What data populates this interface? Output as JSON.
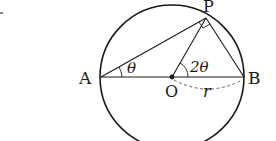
{
  "diagram": {
    "type": "geometry",
    "points": {
      "A": {
        "label": "A",
        "x": 101,
        "y": 77
      },
      "B": {
        "label": "B",
        "x": 244,
        "y": 77
      },
      "O": {
        "label": "O",
        "x": 172,
        "y": 77
      },
      "P": {
        "label": "P",
        "x": 206,
        "y": 18
      }
    },
    "circle": {
      "cx": 172,
      "cy": 77,
      "r": 72
    },
    "angles": {
      "at_A": {
        "label": "θ"
      },
      "at_O": {
        "label": "2θ"
      },
      "at_P": {
        "label": "right-angle"
      }
    },
    "radius_label": "r",
    "colors": {
      "stroke": "#1a1a1a",
      "dashed": "#555555",
      "background": "#ffffff"
    }
  }
}
